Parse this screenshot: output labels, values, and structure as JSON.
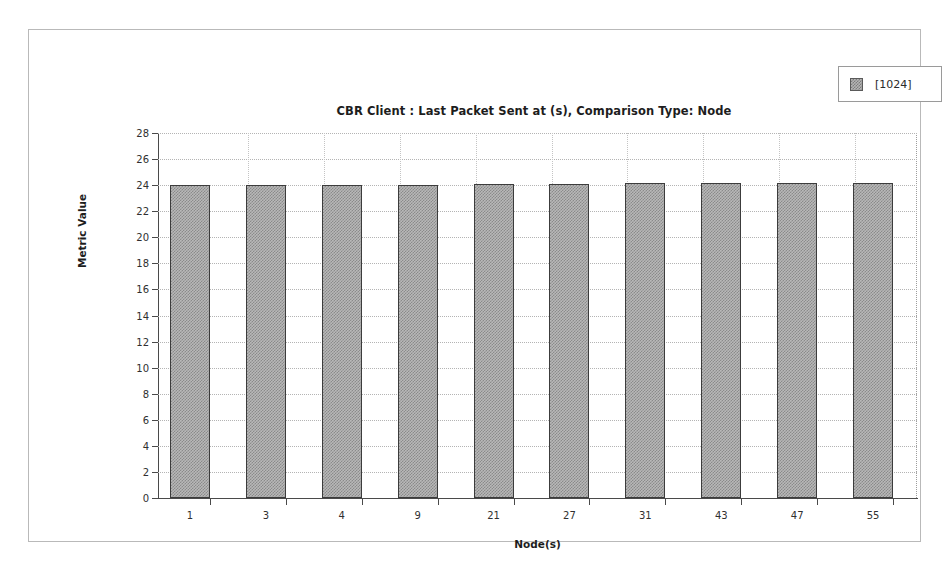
{
  "legend": {
    "position": "top-right",
    "entries": [
      {
        "label": "[1024]",
        "swatch": "checkered-gray-swatch"
      }
    ]
  },
  "chart_data": {
    "type": "bar",
    "title": "CBR Client :  Last Packet Sent at (s), Comparison Type: Node",
    "xlabel": "Node(s)",
    "ylabel": "Metric Value",
    "categories": [
      "1",
      "3",
      "4",
      "9",
      "21",
      "27",
      "31",
      "43",
      "47",
      "55"
    ],
    "series": [
      {
        "name": "[1024]",
        "values": [
          24.0,
          24.05,
          24.05,
          24.05,
          24.1,
          24.1,
          24.15,
          24.15,
          24.2,
          24.2
        ]
      }
    ],
    "ylim": [
      0,
      28
    ],
    "yticks": [
      0,
      2,
      4,
      6,
      8,
      10,
      12,
      14,
      16,
      18,
      20,
      22,
      24,
      26,
      28
    ],
    "ytick_labels": [
      "0",
      "2",
      "4",
      "6",
      "8",
      "10",
      "12",
      "14",
      "16",
      "18",
      "20",
      "22",
      "24",
      "26",
      "28"
    ],
    "grid": true,
    "grid_style": "dotted",
    "legend_position": "top-right",
    "bar_fill": "#b8b8b8",
    "bar_pattern": "checkered",
    "bar_border": "#3c3c3c"
  },
  "colors": {
    "panel_border": "#b9b9b9",
    "axis": "#4a4a4a",
    "gridline": "#b4b4b4",
    "text": "#1d1d1d"
  }
}
